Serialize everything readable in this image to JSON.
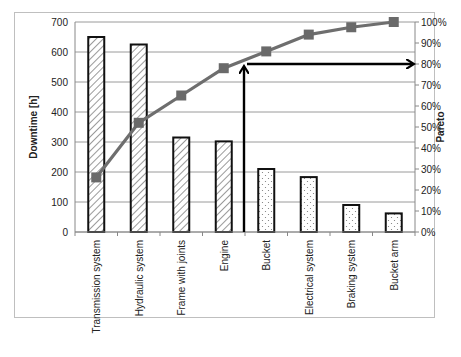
{
  "chart_data": {
    "type": "bar",
    "title": "",
    "xlabel": "",
    "ylabel": "Downtime [h]",
    "y2label": "Pareto",
    "ylim": [
      0,
      700
    ],
    "y2lim": [
      0,
      100
    ],
    "yticks": [
      "0",
      "100",
      "200",
      "300",
      "400",
      "500",
      "600",
      "700"
    ],
    "y2ticks": [
      "0%",
      "10%",
      "20%",
      "30%",
      "40%",
      "50%",
      "60%",
      "70%",
      "80%",
      "90%",
      "100%"
    ],
    "grid": true,
    "legend": "none",
    "categories": [
      "Transmission system",
      "Hydraulic system",
      "Frame with joints",
      "Engine",
      "Bucket",
      "Electrical system",
      "Braking system",
      "Bucket arm"
    ],
    "series": [
      {
        "name": "Downtime [h]",
        "type": "bar",
        "values": [
          650,
          625,
          315,
          302,
          210,
          183,
          90,
          62
        ],
        "patterns": [
          "hatch",
          "hatch",
          "hatch",
          "hatch",
          "dots",
          "dots",
          "dots",
          "dots"
        ]
      },
      {
        "name": "Pareto",
        "type": "line",
        "axis": "right",
        "values": [
          26,
          52,
          65,
          78,
          86,
          94,
          97.5,
          100
        ]
      }
    ],
    "annotations": [
      {
        "type": "arrow",
        "description": "vertical arrow from x-axis between Engine and Bucket up to 80% cumulative line"
      },
      {
        "type": "arrow",
        "description": "horizontal arrow at 80% pointing to right axis"
      }
    ]
  }
}
